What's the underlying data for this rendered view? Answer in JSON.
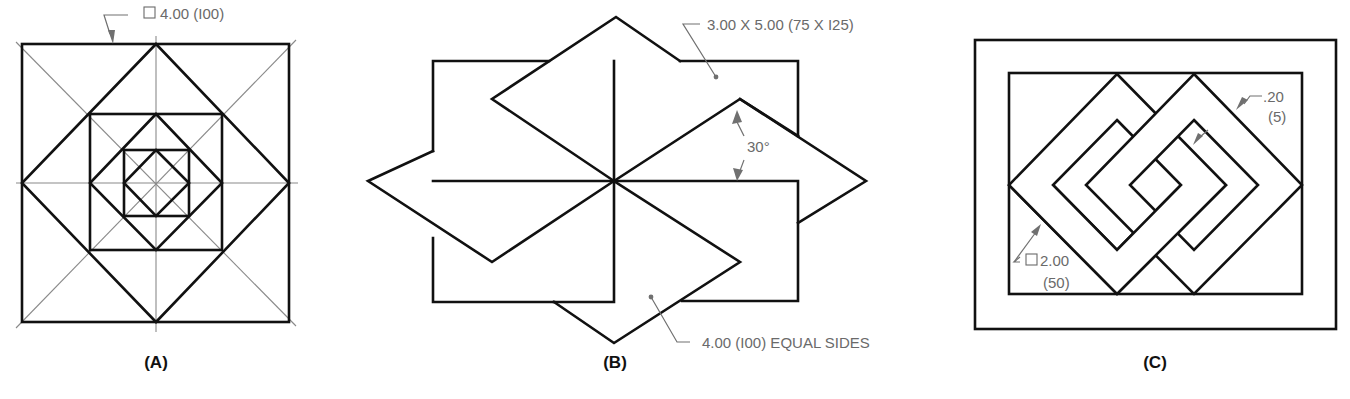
{
  "figure": {
    "panels": [
      {
        "id": "A",
        "caption": "(A)",
        "description": "Nested squares and diamonds with centerlines",
        "dimension": {
          "symbol": "square-symbol",
          "text": "4.00 (I00)"
        }
      },
      {
        "id": "B",
        "caption": "(B)",
        "description": "Pinwheel of four rectangles and four rhombi",
        "dimensions": [
          {
            "text": "3.00 X 5.00 (75 X I25)"
          },
          {
            "text": "30°"
          },
          {
            "text": "4.00 (I00) EQUAL SIDES"
          }
        ]
      },
      {
        "id": "C",
        "caption": "(C)",
        "description": "Two interlocked square rings inside a double border",
        "dimensions": [
          {
            "line1": ".20",
            "line2": "(5)"
          },
          {
            "symbol": "square-symbol",
            "line1": "2.00",
            "line2": "(50)"
          }
        ]
      }
    ],
    "colors": {
      "object_line": "#111111",
      "center_line": "#8a8a8a",
      "dimension": "#6a6a6a"
    }
  }
}
